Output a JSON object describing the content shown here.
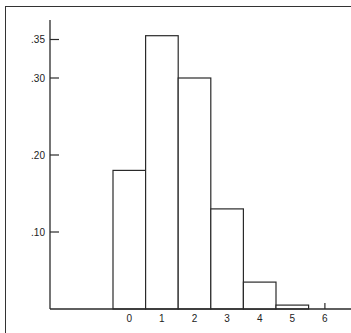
{
  "chart_data": {
    "type": "bar",
    "title": "",
    "xlabel": "",
    "ylabel": "",
    "categories": [
      "0",
      "1",
      "2",
      "3",
      "4",
      "5"
    ],
    "values": [
      0.18,
      0.355,
      0.3,
      0.13,
      0.035,
      0.005
    ],
    "x_tick_labels": [
      "0",
      "1",
      "2",
      "3",
      "4",
      "5",
      "6"
    ],
    "y_tick_labels": [
      ".10",
      ".20",
      ".30",
      ".35"
    ],
    "y_ticks": [
      0.1,
      0.2,
      0.3,
      0.35
    ],
    "ylim": [
      0,
      0.37
    ],
    "grid": false,
    "legend": null,
    "style": "histogram, unfilled bars with black outlines"
  },
  "colors": {
    "bar_stroke": "#2a2a2a",
    "bar_fill": "#ffffff",
    "axis": "#2a2a2a"
  }
}
